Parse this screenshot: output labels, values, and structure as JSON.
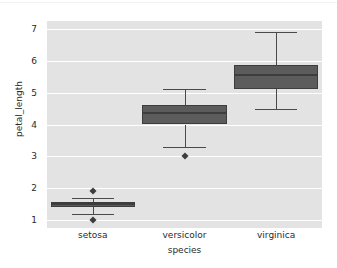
{
  "chart_data": {
    "type": "box",
    "title": "",
    "xlabel": "species",
    "ylabel": "petal_length",
    "categories": [
      "setosa",
      "versicolor",
      "virginica"
    ],
    "ylim": [
      0.75,
      7.25
    ],
    "yticks": [
      1,
      2,
      3,
      4,
      5,
      6,
      7
    ],
    "ytick_labels": [
      "1",
      "2",
      "3",
      "4",
      "5",
      "6",
      "7"
    ],
    "grid": true,
    "grid_axis": "y",
    "legend": "none",
    "colors": {
      "plot_background": "#e3e3e3",
      "figure_background": "#ffffff",
      "gridline": "#ffffff",
      "box_fill": "#5c5c5c",
      "box_edge": "#3d3d3d",
      "median": "#3d3d3d",
      "whisker": "#4a4a4a",
      "flier": "#3d3d3d",
      "text": "#2b2b2b"
    },
    "boxes": [
      {
        "category": "setosa",
        "whisker_low": 1.2,
        "q1": 1.4,
        "median": 1.5,
        "q3": 1.575,
        "whisker_high": 1.7,
        "fliers": [
          1.0,
          1.9
        ]
      },
      {
        "category": "versicolor",
        "whisker_low": 3.3,
        "q1": 4.0,
        "median": 4.35,
        "q3": 4.6,
        "whisker_high": 5.1,
        "fliers": [
          3.0
        ]
      },
      {
        "category": "virginica",
        "whisker_low": 4.5,
        "q1": 5.1,
        "median": 5.55,
        "q3": 5.875,
        "whisker_high": 6.9,
        "fliers": []
      }
    ]
  }
}
